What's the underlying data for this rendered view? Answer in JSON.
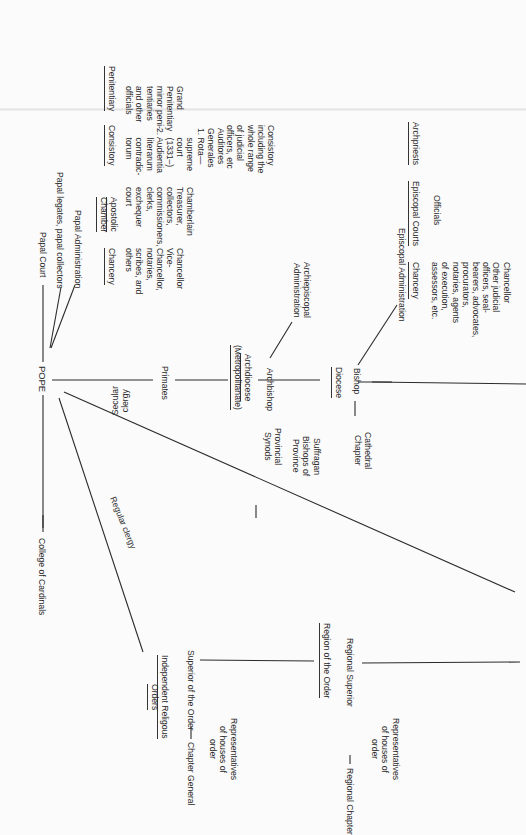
{
  "diagram": {
    "orientation": "rotated 90 degrees clockwise (text reads top-to-bottom)",
    "root": "POPE",
    "branches": {
      "papal_court": "Papal Court",
      "papal_legates": "Papal legates, papal collectors",
      "papal_administration": "Papal Administration",
      "college_of_cardinals": "College of Cardinals",
      "secular_clergy_label": "Secular\nclergy",
      "regular_clergy_label": "Regular clergy"
    },
    "papal_offices": [
      {
        "heading": "Chancery",
        "body": "Chancellor\nVice-\nChancellor,\nnotaries,\nscribes, and\nothers"
      },
      {
        "heading": "Apostolic\nChamber",
        "body": "Chamberlain\nTreasurer,\ncollectors,\ncommissioners,\nclerks,\nexchequer\ncourt"
      },
      {
        "heading": "Consistory",
        "body": "Auditores\nGenerales\n1. Rota—\n    supreme\n    court\n    (1331–)\n2. Audientia\n    literarum\n    contradic-\n    torum",
        "note": "Consistory\nincluding the\nwhole range\nof judicial\nofficers, etc"
      },
      {
        "heading": "Penitentiary",
        "body": "Grand\nPenitentiary\nminor peni-\ntentiaries\nand other\nofficials"
      }
    ],
    "secular": {
      "primates": "Primates",
      "archdiocese": "Archdiocese\n(Metropolitanate)",
      "archbishop": "Archbishop",
      "archiepiscopal_admin": "Archiepiscopal\nAdministration",
      "provincial_synods": "Provincial\nSynods",
      "suffragan": "Suffragan\nBishops of\nProvince",
      "diocese": "Diocese",
      "bishop": "Bishop",
      "cathedral_chapter": "Cathedral\nChapter",
      "episcopal_admin": "Episcopal Administration",
      "episcopal_chancery": "Chancery",
      "episcopal_chancery_body": "Chancellor\nOther judicial\nofficers, seal-\nbearers, advocates,\nprocurators,\nnotaries, agents\nof execution,\nassessors, etc.",
      "episcopal_courts": "Episcopal Courts",
      "officials": "Officials",
      "archpriests": "Archpriests"
    },
    "regular": {
      "independent_orders": "Independent Religous\nOrders",
      "superior": "Superior of the Order",
      "chapter_general": "Chapter General",
      "representatives_1": "Representatives\nof houses of\norder",
      "region": "Region of the Order",
      "regional_superior": "Regional Superior",
      "regional_chapter": "Regional Chapter",
      "representatives_2": "Representatives\nof houses of\norder"
    }
  }
}
